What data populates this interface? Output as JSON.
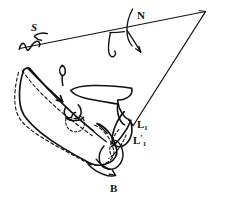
{
  "figure": {
    "id": "B",
    "caption_label": "B",
    "type": "cephalometric-tracing",
    "ink_color": "#111111",
    "background_color": "#ffffff"
  },
  "landmarks": {
    "sella": {
      "label": "S",
      "name": "Sella",
      "x": 31,
      "y": 28
    },
    "nasion": {
      "label": "N",
      "name": "Nasion",
      "x": 137,
      "y": 16
    },
    "lower_incisor": {
      "label": "L",
      "subscript": "1",
      "name": "Lower incisor",
      "x": 137,
      "y": 125
    },
    "lower_incisor_superimposed": {
      "label": "L",
      "prime": "′",
      "subscript": "1",
      "name": "Lower incisor superimposed",
      "x": 133,
      "y": 140
    }
  },
  "reference_lines": [
    {
      "name": "sella-nasion-line",
      "from": "S",
      "to": "apex",
      "style": "solid"
    },
    {
      "name": "apex-to-lower-incisor-line",
      "from": "apex",
      "to": "L1",
      "style": "solid"
    }
  ],
  "outline_styles": {
    "original_tracing": "solid",
    "superimposed_tracing": "dashed"
  },
  "anatomy_parts": [
    "sella-turcica",
    "nasal-bone-profile",
    "mandible-ramus",
    "mandible-body",
    "symphysis",
    "maxilla",
    "molar-tooth",
    "incisor-tooth"
  ]
}
